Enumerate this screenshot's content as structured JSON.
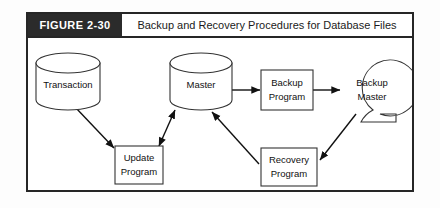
{
  "figure": {
    "tag": "FIGURE 2-30",
    "title": "Backup and Recovery Procedures for Database Files"
  },
  "diagram": {
    "type": "flowchart",
    "nodes": [
      {
        "id": "transaction",
        "label": "Transaction",
        "shape": "cylinder"
      },
      {
        "id": "master",
        "label": "Master",
        "shape": "cylinder"
      },
      {
        "id": "update-program",
        "label_line1": "Update",
        "label_line2": "Program",
        "shape": "rectangle"
      },
      {
        "id": "backup-program",
        "label_line1": "Backup",
        "label_line2": "Program",
        "shape": "rectangle"
      },
      {
        "id": "recovery-program",
        "label_line1": "Recovery",
        "label_line2": "Program",
        "shape": "rectangle"
      },
      {
        "id": "backup-master",
        "label_line1": "Backup",
        "label_line2": "Master",
        "shape": "magnetic-tape"
      }
    ],
    "edges": [
      {
        "from": "transaction",
        "to": "update-program",
        "arrows": "single"
      },
      {
        "from": "update-program",
        "to": "master",
        "arrows": "double"
      },
      {
        "from": "master",
        "to": "backup-program",
        "arrows": "single"
      },
      {
        "from": "backup-program",
        "to": "backup-master",
        "arrows": "single"
      },
      {
        "from": "backup-master",
        "to": "recovery-program",
        "arrows": "single"
      },
      {
        "from": "recovery-program",
        "to": "master",
        "arrows": "single"
      }
    ]
  },
  "colors": {
    "frame": "#262626",
    "tag_background": "#2b2b2b",
    "tag_text": "#ffffff",
    "title_text": "#1b1b1b",
    "shape_stroke": "#333333",
    "edge_stroke": "#111111",
    "canvas": "#ffffff"
  }
}
